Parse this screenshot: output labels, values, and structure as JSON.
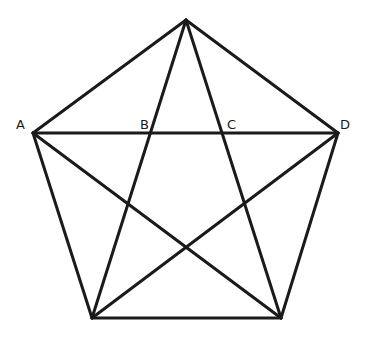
{
  "figure": {
    "background_color": "#ffffff",
    "stroke_color": "#1a1a1a",
    "stroke_width": 3,
    "label_color": "#1a1a1a",
    "label_font_size": 13
  },
  "points": {
    "top": {
      "name": "top-vertex",
      "x": 186,
      "y": 20
    },
    "left": {
      "name": "left-vertex-A",
      "x": 33,
      "y": 133
    },
    "right": {
      "name": "right-vertex-D",
      "x": 338,
      "y": 133
    },
    "bottom_left": {
      "name": "bottom-left-vertex",
      "x": 92,
      "y": 318
    },
    "bottom_right": {
      "name": "bottom-right-vertex",
      "x": 281,
      "y": 318
    },
    "intersection_B": {
      "name": "intersection-B",
      "x": 155,
      "y": 133
    },
    "intersection_C": {
      "name": "intersection-C",
      "x": 222,
      "y": 133
    }
  },
  "edges": [
    {
      "id": "edge-top-left",
      "from": "top",
      "to": "left"
    },
    {
      "id": "edge-top-right",
      "from": "top",
      "to": "right"
    },
    {
      "id": "edge-left-bottom-left",
      "from": "left",
      "to": "bottom_left"
    },
    {
      "id": "edge-right-bottom-right",
      "from": "right",
      "to": "bottom_right"
    },
    {
      "id": "edge-bottom",
      "from": "bottom_left",
      "to": "bottom_right"
    }
  ],
  "diagonals": [
    {
      "id": "diagonal-left-right",
      "from": "left",
      "to": "right"
    },
    {
      "id": "diagonal-top-bottom-left",
      "from": "top",
      "to": "bottom_left"
    },
    {
      "id": "diagonal-top-bottom-right",
      "from": "top",
      "to": "bottom_right"
    },
    {
      "id": "diagonal-left-bottom-right",
      "from": "left",
      "to": "bottom_right"
    },
    {
      "id": "diagonal-right-bottom-left",
      "from": "right",
      "to": "bottom_left"
    }
  ],
  "labels": [
    {
      "id": "label-A",
      "text": "A",
      "x": 16,
      "y": 118,
      "anchor_point": "left"
    },
    {
      "id": "label-B",
      "text": "B",
      "x": 140,
      "y": 118,
      "anchor_point": "intersection_B"
    },
    {
      "id": "label-C",
      "text": "C",
      "x": 227,
      "y": 118,
      "anchor_point": "intersection_C"
    },
    {
      "id": "label-D",
      "text": "D",
      "x": 340,
      "y": 118,
      "anchor_point": "right"
    }
  ]
}
